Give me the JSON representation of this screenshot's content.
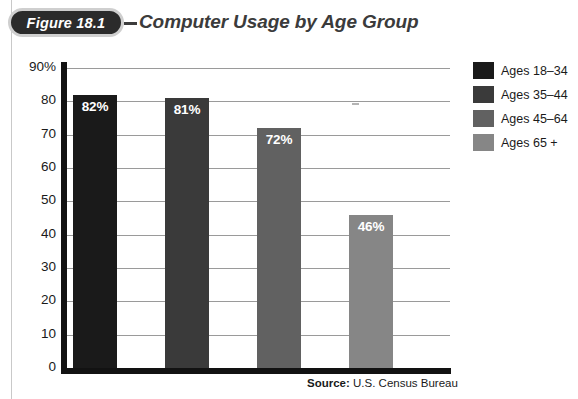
{
  "figure": {
    "badge_label": "Figure 18.1",
    "title": "Computer Usage by Age Group"
  },
  "source": {
    "prefix": "Source:",
    "text": " U.S. Census Bureau"
  },
  "legend": {
    "items": [
      {
        "label": "Ages 18–34",
        "color": "#1a1a1a"
      },
      {
        "label": "Ages 35–44",
        "color": "#3a3a3a"
      },
      {
        "label": "Ages 45–64",
        "color": "#616161"
      },
      {
        "label": "Ages 65 +",
        "color": "#868686"
      }
    ]
  },
  "chart_data": {
    "type": "bar",
    "title": "Computer Usage by Age Group",
    "xlabel": "",
    "ylabel": "",
    "ylim": [
      0,
      90
    ],
    "grid": true,
    "legend_position": "right",
    "categories": [
      "Ages 18–34",
      "Ages 35–44",
      "Ages 45–64",
      "Ages 65 +"
    ],
    "values": [
      82,
      81,
      72,
      46
    ],
    "value_labels": [
      "82%",
      "81%",
      "72%",
      "46%"
    ],
    "bar_colors": [
      "#1a1a1a",
      "#3a3a3a",
      "#616161",
      "#868686"
    ],
    "ytick_labels": [
      "90%",
      "80",
      "70",
      "60",
      "50",
      "40",
      "30",
      "20",
      "10",
      "0"
    ],
    "ytick_values": [
      90,
      80,
      70,
      60,
      50,
      40,
      30,
      20,
      10,
      0
    ],
    "source": "Source: U.S. Census Bureau"
  }
}
